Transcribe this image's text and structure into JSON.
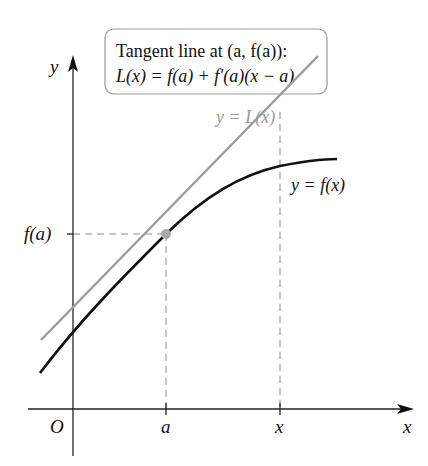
{
  "caption_box": {
    "line1": "Tangent line at (a, f(a)):",
    "line2": "L(x) = f(a) + f′(a)(x − a)"
  },
  "axes": {
    "y_label": "y",
    "x_label": "x",
    "origin_label": "O"
  },
  "ticks": {
    "x_a": "a",
    "x_x": "x",
    "y_fa": "f(a)"
  },
  "curves": {
    "tangent_label": "y = L(x)",
    "function_label": "y = f(x)"
  },
  "colors": {
    "function_curve": "#111111",
    "tangent_line": "#9a9a9a",
    "point": "#a8a8a8",
    "dashed": "#8a8a8a",
    "box_border": "#999999"
  }
}
